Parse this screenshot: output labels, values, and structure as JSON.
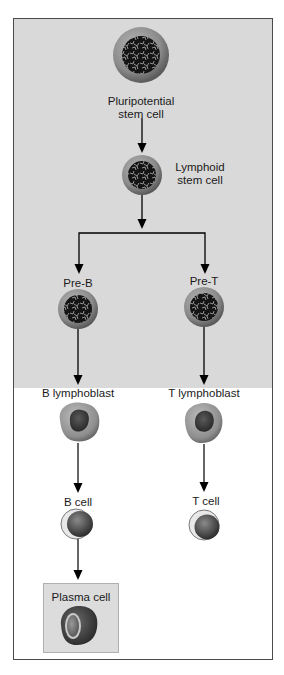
{
  "diagram": {
    "nodes": {
      "pluripotential": {
        "label_line1": "Pluripotential",
        "label_line2": "stem cell"
      },
      "lymphoid": {
        "label_line1": "Lymphoid",
        "label_line2": "stem cell"
      },
      "pre_b": {
        "label": "Pre-B"
      },
      "pre_t": {
        "label": "Pre-T"
      },
      "b_lymphoblast": {
        "label": "B lymphoblast"
      },
      "t_lymphoblast": {
        "label": "T lymphoblast"
      },
      "b_cell": {
        "label": "B cell"
      },
      "t_cell": {
        "label": "T cell"
      },
      "plasma_cell": {
        "label": "Plasma cell"
      }
    },
    "edges": [
      [
        "pluripotential",
        "lymphoid"
      ],
      [
        "lymphoid",
        "pre_b"
      ],
      [
        "lymphoid",
        "pre_t"
      ],
      [
        "pre_b",
        "b_lymphoblast"
      ],
      [
        "pre_t",
        "t_lymphoblast"
      ],
      [
        "b_lymphoblast",
        "b_cell"
      ],
      [
        "t_lymphoblast",
        "t_cell"
      ],
      [
        "b_cell",
        "plasma_cell"
      ]
    ],
    "colors": {
      "upper_background": "#d9d9d9",
      "lower_background": "#ffffff",
      "frame": "#4a4a4a",
      "plasma_box": "#dcdcdc"
    }
  }
}
